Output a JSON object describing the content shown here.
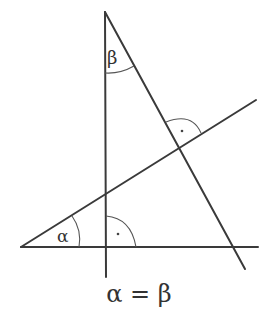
{
  "diagram": {
    "type": "geometry",
    "labels": {
      "alpha": "α",
      "beta": "β",
      "right_angle_mark": "·"
    },
    "caption": "α = β",
    "line_color": "#3a3a3a"
  }
}
